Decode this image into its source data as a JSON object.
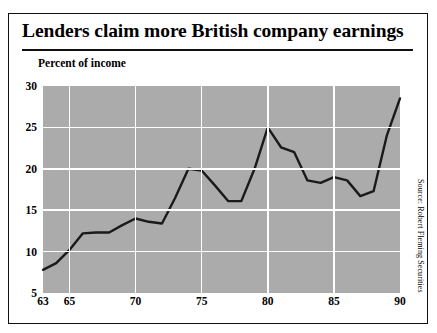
{
  "header": {
    "title": "Lenders claim more British company earnings"
  },
  "source_note": "Source: Robert Fleming Securities",
  "chart_data": {
    "type": "line",
    "title": "Lenders claim more British company earnings",
    "subtitle": "Percent of income",
    "xlabel": "",
    "ylabel": "Percent of income",
    "xlim": [
      63,
      90
    ],
    "ylim": [
      5,
      30
    ],
    "grid": true,
    "legend": false,
    "y_ticks": [
      5,
      10,
      15,
      20,
      25,
      30
    ],
    "x_ticks": [
      63,
      65,
      70,
      75,
      80,
      85,
      90
    ],
    "x_gridlines": [
      65,
      70,
      75,
      80,
      85
    ],
    "series": [
      {
        "name": "Percent of income",
        "color": "#1a1a1a",
        "x": [
          63,
          64,
          65,
          66,
          67,
          68,
          69,
          70,
          71,
          72,
          73,
          74,
          75,
          76,
          77,
          78,
          79,
          80,
          81,
          82,
          83,
          84,
          85,
          86,
          87,
          88,
          89,
          90
        ],
        "values": [
          7.8,
          8.6,
          10.2,
          12.2,
          12.3,
          12.3,
          13.2,
          14.0,
          13.6,
          13.4,
          16.5,
          20.0,
          19.8,
          18.0,
          16.1,
          16.1,
          20.0,
          25.0,
          22.6,
          22.0,
          18.6,
          18.3,
          19.0,
          18.6,
          16.7,
          17.3,
          24.0,
          28.5
        ]
      }
    ]
  }
}
